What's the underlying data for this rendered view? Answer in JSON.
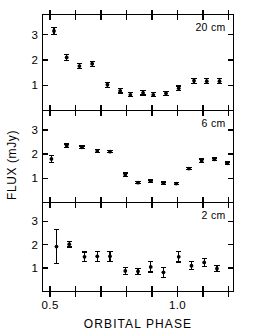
{
  "chart_data": {
    "type": "scatter",
    "title": "",
    "xlabel": "ORBITAL PHASE",
    "ylabel": "FLUX (mJy)",
    "xlim": [
      0.47,
      1.22
    ],
    "ylim": [
      0.0,
      3.8
    ],
    "xticks": [
      0.5,
      0.6,
      0.7,
      0.8,
      0.9,
      1.0,
      1.1,
      1.2
    ],
    "xtick_labels": [
      "0.5",
      "",
      "",
      "",
      "",
      "1.0",
      "",
      ""
    ],
    "yticks": [
      1,
      2,
      3
    ],
    "ytick_labels": [
      "1",
      "2",
      "3"
    ],
    "grid": false,
    "legend_position": "inside-top-right",
    "error_bars": "vertical",
    "panels": [
      {
        "label": "20 cm",
        "x": [
          0.515,
          0.565,
          0.615,
          0.665,
          0.725,
          0.775,
          0.815,
          0.865,
          0.905,
          0.955,
          1.005,
          1.065,
          1.115,
          1.165
        ],
        "y": [
          3.15,
          2.1,
          1.76,
          1.85,
          1.02,
          0.78,
          0.62,
          0.7,
          0.62,
          0.68,
          0.88,
          1.18,
          1.16,
          1.16
        ],
        "yerr": [
          0.14,
          0.13,
          0.1,
          0.1,
          0.1,
          0.09,
          0.08,
          0.09,
          0.08,
          0.08,
          0.09,
          0.1,
          0.1,
          0.1
        ]
      },
      {
        "label": "6 cm",
        "x": [
          0.505,
          0.565,
          0.625,
          0.685,
          0.735,
          0.795,
          0.845,
          0.895,
          0.945,
          0.995,
          1.045,
          1.095,
          1.145,
          1.195
        ],
        "y": [
          1.8,
          2.35,
          2.28,
          2.13,
          2.1,
          1.15,
          0.82,
          0.88,
          0.8,
          0.78,
          1.4,
          1.72,
          1.78,
          1.62
        ],
        "yerr": [
          0.14,
          0.07,
          0.05,
          0.05,
          0.05,
          0.07,
          0.05,
          0.05,
          0.05,
          0.05,
          0.05,
          0.08,
          0.06,
          0.05
        ]
      },
      {
        "label": "2 cm",
        "x": [
          0.525,
          0.575,
          0.635,
          0.685,
          0.735,
          0.795,
          0.845,
          0.895,
          0.945,
          1.005,
          1.055,
          1.105,
          1.155
        ],
        "y": [
          1.92,
          2.02,
          1.48,
          1.5,
          1.5,
          0.88,
          0.86,
          1.05,
          0.82,
          1.48,
          1.1,
          1.24,
          0.98
        ],
        "yerr": [
          0.72,
          0.12,
          0.21,
          0.21,
          0.21,
          0.14,
          0.13,
          0.22,
          0.22,
          0.22,
          0.17,
          0.17,
          0.12
        ]
      }
    ]
  }
}
